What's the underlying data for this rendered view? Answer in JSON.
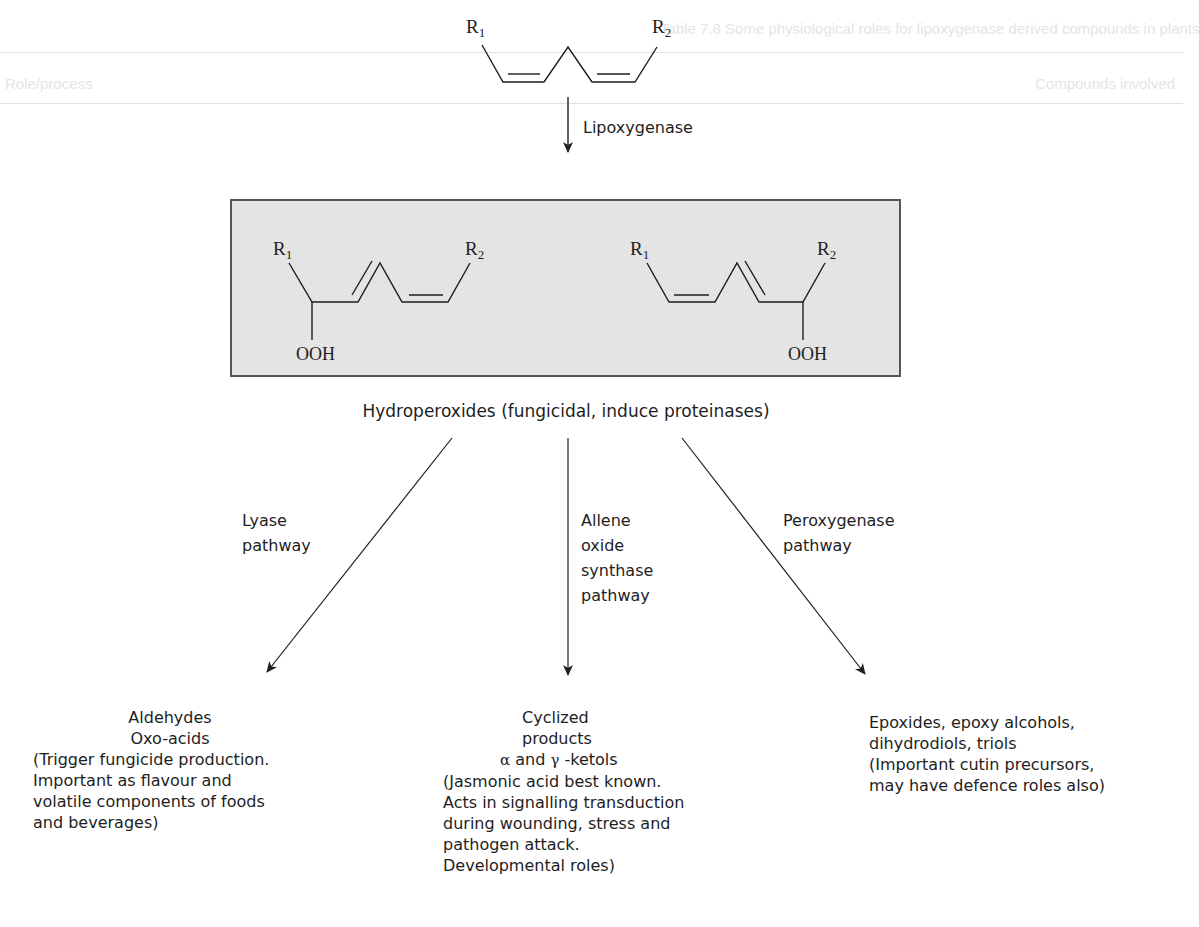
{
  "figure": {
    "substrate": {
      "r1": "R",
      "r1_sub": "1",
      "r2": "R",
      "r2_sub": "2"
    },
    "enzyme_step": {
      "label": "Lipoxygenase"
    },
    "intermediates_box": {
      "left_molecule": {
        "r1": "R",
        "r1_sub": "1",
        "r2": "R",
        "r2_sub": "2",
        "group": "OOH"
      },
      "right_molecule": {
        "r1": "R",
        "r1_sub": "1",
        "r2": "R",
        "r2_sub": "2",
        "group": "OOH"
      },
      "fill_color": "#e4e4e4"
    },
    "intermediate_caption": "Hydroperoxides (fungicidal, induce proteinases)",
    "pathways": [
      {
        "label_lines": [
          "Lyase",
          "pathway"
        ],
        "products": {
          "title_lines": [
            "Aldehydes",
            "Oxo-acids"
          ],
          "description_lines": [
            "(Trigger fungicide production.",
            "Important as flavour and",
            "volatile components of foods",
            "and beverages)"
          ]
        }
      },
      {
        "label_lines": [
          "Allene",
          "oxide",
          "synthase",
          "pathway"
        ],
        "products": {
          "title_lines": [
            "Cyclized",
            "products"
          ],
          "ketols": {
            "alpha": "α",
            "mid": " and ",
            "gamma": "γ",
            "tail": " -ketols"
          },
          "description_lines": [
            "(Jasmonic acid best known.",
            "Acts in signalling transduction",
            "during wounding, stress and",
            "pathogen attack.",
            "Developmental roles)"
          ]
        }
      },
      {
        "label_lines": [
          "Peroxygenase",
          "pathway"
        ],
        "products": {
          "title_lines": [
            "Epoxides, epoxy alcohols,",
            "dihydrodiols, triols"
          ],
          "description_lines": [
            "(Important cutin precursors,",
            "may have defence roles also)"
          ]
        }
      }
    ]
  },
  "bleed_through": {
    "header": "Table 7.8 Some physiological roles for lipoxygenase derived compounds in plants",
    "col_left": "Role/process",
    "col_right": "Compounds involved"
  },
  "colors": {
    "ink": "#1e1e1e",
    "box_fill": "#e4e4e4",
    "box_border": "#555555",
    "background": "#ffffff"
  }
}
